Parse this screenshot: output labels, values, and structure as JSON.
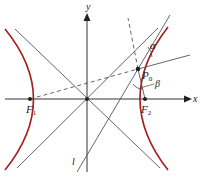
{
  "diagram": {
    "colors": {
      "curve": "#a51c1c",
      "lines": "#555555",
      "axes": "#333333",
      "text": "#222222"
    },
    "axes": {
      "x_label": "x",
      "y_label": "y"
    },
    "points": {
      "focus_left": {
        "label": "F",
        "sub": "1"
      },
      "focus_right": {
        "label": "F",
        "sub": "2"
      },
      "point_on_curve": {
        "label": "P",
        "sub": "0"
      }
    },
    "angles": {
      "alpha": "α",
      "beta": "β"
    },
    "tangent_line_label": "l"
  }
}
